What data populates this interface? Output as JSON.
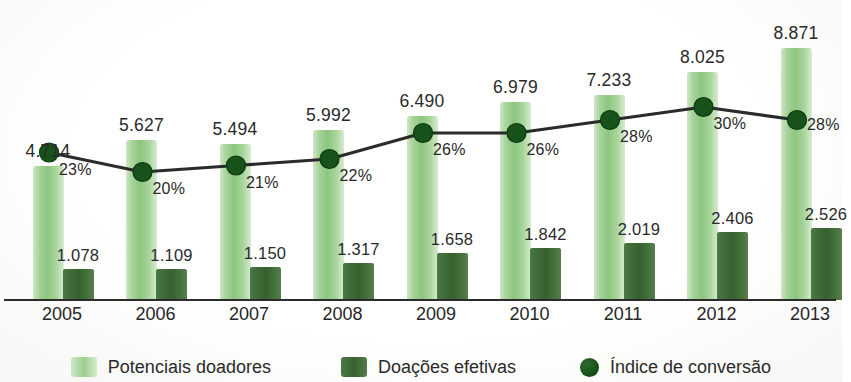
{
  "chart_data": {
    "type": "bar",
    "title": "",
    "subtitle": "",
    "xlabel": "",
    "ylabel": "",
    "grid": false,
    "legend_position": "bottom",
    "categories": [
      "2005",
      "2006",
      "2007",
      "2008",
      "2009",
      "2010",
      "2011",
      "2012",
      "2013"
    ],
    "series": [
      {
        "name": "Potenciais doadores",
        "type": "bar",
        "color": "#9ccf8f",
        "values": [
          4714,
          5627,
          5494,
          5992,
          6490,
          6979,
          7233,
          8025,
          8871
        ],
        "labels": [
          "4.714",
          "5.627",
          "5.494",
          "5.992",
          "6.490",
          "6.979",
          "7.233",
          "8.025",
          "8.871"
        ]
      },
      {
        "name": "Doações efetivas",
        "type": "bar",
        "color": "#3f6d3a",
        "values": [
          1078,
          1109,
          1150,
          1317,
          1658,
          1842,
          2019,
          2406,
          2526
        ],
        "labels": [
          "1.078",
          "1.109",
          "1.150",
          "1.317",
          "1.658",
          "1.842",
          "2.019",
          "2.406",
          "2.526"
        ]
      },
      {
        "name": "Índice de conversão",
        "type": "line",
        "color": "#17521a",
        "values": [
          23,
          20,
          21,
          22,
          26,
          26,
          28,
          30,
          28
        ],
        "labels": [
          "23%",
          "20%",
          "21%",
          "22%",
          "26%",
          "26%",
          "28%",
          "30%",
          "28%"
        ]
      }
    ],
    "ylim": [
      0,
      9500
    ],
    "ylim_secondary": [
      0,
      40
    ]
  },
  "legend": {
    "items": [
      {
        "label": "Potenciais doadores",
        "swatch": "light-green-bar-swatch"
      },
      {
        "label": "Doações efetivas",
        "swatch": "dark-green-bar-swatch"
      },
      {
        "label": "Índice de conversão",
        "swatch": "dark-green-dot-marker"
      }
    ]
  },
  "colors": {
    "bar_light": "#9ccf8f",
    "bar_dark": "#3f6d3a",
    "line": "#2b2b2b",
    "marker": "#17521a",
    "axis": "#2b2b2b",
    "text": "#2a2a2a",
    "background": "#fdfdfd"
  }
}
